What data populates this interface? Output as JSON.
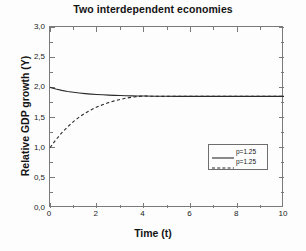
{
  "chart_data": {
    "type": "line",
    "title": "Two interdependent economies",
    "xlabel": "Time (t)",
    "ylabel": "Relative GDP growth (Y)",
    "xlim": [
      0,
      10
    ],
    "ylim": [
      0.0,
      3.0
    ],
    "xticks": [
      "0",
      "2",
      "4",
      "6",
      "8",
      "10"
    ],
    "xtick_values": [
      0,
      2,
      4,
      6,
      8,
      10
    ],
    "yticks": [
      "0,0",
      "0,5",
      "1,0",
      "1,5",
      "2,0",
      "2,5",
      "3,0"
    ],
    "ytick_values": [
      0.0,
      0.5,
      1.0,
      1.5,
      2.0,
      2.5,
      3.0
    ],
    "decimal_separator": ",",
    "grid": false,
    "legend_position": "lower right",
    "equilibrium_value": 1.85,
    "series": [
      {
        "name": "p=1.25",
        "style": "solid",
        "color": "#2b2b2b",
        "x": [
          0,
          0.25,
          0.5,
          0.75,
          1,
          1.25,
          1.5,
          1.75,
          2,
          2.25,
          2.5,
          2.75,
          3,
          3.25,
          3.5,
          3.75,
          4,
          4.5,
          5,
          5.5,
          6,
          6.5,
          7,
          7.5,
          8,
          8.5,
          9,
          9.5,
          10
        ],
        "values": [
          2.0,
          1.972,
          1.95,
          1.932,
          1.918,
          1.906,
          1.896,
          1.888,
          1.881,
          1.876,
          1.871,
          1.867,
          1.864,
          1.861,
          1.859,
          1.857,
          1.856,
          1.853,
          1.851,
          1.85,
          1.85,
          1.85,
          1.85,
          1.85,
          1.85,
          1.85,
          1.85,
          1.85,
          1.85
        ]
      },
      {
        "name": "p=1.25",
        "style": "dashed",
        "color": "#2b2b2b",
        "x": [
          0,
          0.25,
          0.5,
          0.75,
          1,
          1.25,
          1.5,
          1.75,
          2,
          2.25,
          2.5,
          2.75,
          3,
          3.25,
          3.5,
          3.75,
          4,
          4.5,
          5,
          5.5,
          6,
          6.5,
          7,
          7.5,
          8,
          8.5,
          9,
          9.5,
          10
        ],
        "values": [
          1.0,
          1.13,
          1.245,
          1.345,
          1.432,
          1.507,
          1.571,
          1.626,
          1.673,
          1.713,
          1.747,
          1.776,
          1.8,
          1.82,
          1.836,
          1.849,
          1.856,
          1.851,
          1.85,
          1.85,
          1.85,
          1.85,
          1.85,
          1.85,
          1.85,
          1.85,
          1.85,
          1.85,
          1.85
        ]
      }
    ],
    "legend_entries": [
      {
        "label": "p=1.25",
        "style": "solid"
      },
      {
        "label": "p=1.25",
        "style": "dashed"
      }
    ]
  },
  "colors": {
    "background": "#fdfdfd",
    "axis": "#7a7a7a",
    "text": "#141414",
    "curve": "#2b2b2b"
  }
}
